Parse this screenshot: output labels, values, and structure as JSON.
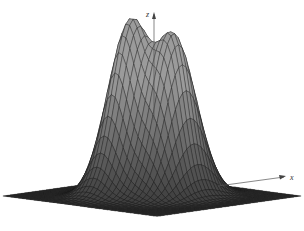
{
  "figure": {
    "title": ""
  },
  "colors": {
    "background": "#ffffff",
    "surface_fill": "#9a9a9a",
    "mesh_line": "#1a1a1a",
    "axis": "#555555"
  },
  "chart_data": {
    "type": "surface",
    "title": "",
    "axes": {
      "z_label": "z",
      "x_label": "x"
    },
    "surface": {
      "description": "sum of two Gaussian bumps",
      "peaks": [
        {
          "name": "left-peak",
          "x": -0.6,
          "y": 0.3,
          "height": 1.0
        },
        {
          "name": "right-peak",
          "x": 0.6,
          "y": -0.3,
          "height": 0.92
        }
      ],
      "domain": {
        "x": [
          -3,
          3
        ],
        "y": [
          -3,
          3
        ]
      },
      "grid_lines": 40
    },
    "ticks": [],
    "legend": null,
    "grid": false
  }
}
